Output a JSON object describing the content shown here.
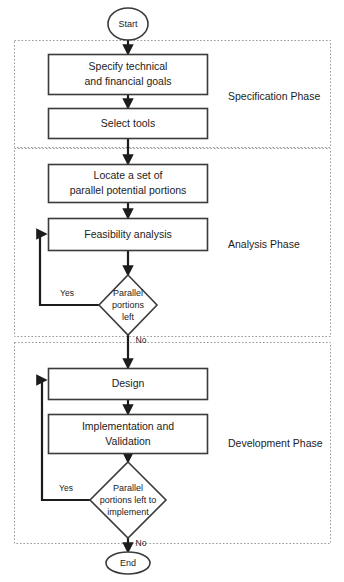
{
  "diagram": {
    "type": "flowchart",
    "title": "",
    "canvas": {
      "width": 344,
      "height": 582
    },
    "colors": {
      "background": "#ffffff",
      "node_stroke": "#3b3b3b",
      "node_fill": "#ffffff",
      "connector": "#1c1c1c",
      "phase_border": "#9a9a9a",
      "text": "#1c1c1c"
    }
  },
  "phases": [
    {
      "id": "specification",
      "label": "Specification Phase"
    },
    {
      "id": "analysis",
      "label": "Analysis Phase"
    },
    {
      "id": "development",
      "label": "Development Phase"
    }
  ],
  "nodes": {
    "start": {
      "label": "Start",
      "shape": "ellipse"
    },
    "specify_goals": {
      "line1": "Specify technical",
      "line2": "and financial goals",
      "shape": "rectangle"
    },
    "select_tools": {
      "label": "Select tools",
      "shape": "rectangle"
    },
    "locate_portions": {
      "line1": "Locate a set of",
      "line2": "parallel potential portions",
      "shape": "rectangle"
    },
    "feasibility": {
      "label": "Feasibility analysis",
      "shape": "rectangle"
    },
    "decision_analysis": {
      "line1": "Parallel",
      "line2": "portions",
      "line3": "left",
      "shape": "diamond"
    },
    "design": {
      "label": "Design",
      "shape": "rectangle"
    },
    "implementation": {
      "line1": "Implementation and",
      "line2": "Validation",
      "shape": "rectangle"
    },
    "decision_development": {
      "line1": "Parallel",
      "line2": "portions left to",
      "line3": "implement",
      "shape": "diamond"
    },
    "end": {
      "label": "End",
      "shape": "ellipse"
    }
  },
  "edge_labels": {
    "analysis_yes": "Yes",
    "analysis_no": "No",
    "development_yes": "Yes",
    "development_no": "No"
  }
}
